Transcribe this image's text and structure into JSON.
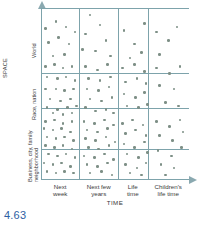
{
  "figure": {
    "number_label": "4.63",
    "number_color": "#2e5fa3"
  },
  "axes": {
    "y_title": "SPACE",
    "x_title": "TIME",
    "y_categories": [
      {
        "label": "Business, city, family",
        "label2": "neighborhood"
      },
      {
        "label": "Race, nation",
        "label2": ""
      },
      {
        "label": "World",
        "label2": ""
      }
    ],
    "x_categories": [
      {
        "line1": "Next",
        "line2": "week"
      },
      {
        "line1": "Next few",
        "line2": "years"
      },
      {
        "line1": "Life",
        "line2": "time"
      },
      {
        "line1": "Children's",
        "line2": "life time"
      }
    ]
  },
  "style": {
    "grid_color": "#7da3ab",
    "dot_color": "#7d8f86",
    "text_color": "#3a3a3a",
    "background": "#ffffff"
  },
  "chart_data": {
    "type": "scatter",
    "title": "",
    "xlabel": "TIME",
    "ylabel": "SPACE",
    "grid": true,
    "legend": "none",
    "x_tick_labels": [
      "Next week",
      "Next few years",
      "Life time",
      "Children's life time"
    ],
    "y_tick_labels": [
      "Business, city, family neighborhood",
      "Race, nation",
      "World"
    ],
    "x_band_edges_pct": [
      0,
      26,
      52,
      72,
      100
    ],
    "y_band_edges_pct": [
      0,
      18,
      42,
      62,
      100
    ],
    "cell_counts": [
      {
        "x_band": 0,
        "y_band": 0,
        "count": 46
      },
      {
        "x_band": 1,
        "y_band": 0,
        "count": 30
      },
      {
        "x_band": 2,
        "y_band": 0,
        "count": 13
      },
      {
        "x_band": 3,
        "y_band": 0,
        "count": 4
      },
      {
        "x_band": 0,
        "y_band": 1,
        "count": 35
      },
      {
        "x_band": 1,
        "y_band": 1,
        "count": 24
      },
      {
        "x_band": 2,
        "y_band": 1,
        "count": 14
      },
      {
        "x_band": 3,
        "y_band": 1,
        "count": 6
      },
      {
        "x_band": 0,
        "y_band": 2,
        "count": 22
      },
      {
        "x_band": 1,
        "y_band": 2,
        "count": 18
      },
      {
        "x_band": 2,
        "y_band": 2,
        "count": 12
      },
      {
        "x_band": 3,
        "y_band": 2,
        "count": 6
      },
      {
        "x_band": 0,
        "y_band": 3,
        "count": 5
      },
      {
        "x_band": 1,
        "y_band": 3,
        "count": 6
      },
      {
        "x_band": 2,
        "y_band": 3,
        "count": 4
      },
      {
        "x_band": 3,
        "y_band": 3,
        "count": 4
      }
    ],
    "points": [
      [
        3,
        12
      ],
      [
        10,
        8
      ],
      [
        17,
        11
      ],
      [
        5,
        20
      ],
      [
        12,
        17
      ],
      [
        19,
        21
      ],
      [
        23,
        14
      ],
      [
        8,
        28
      ],
      [
        16,
        27
      ],
      [
        33,
        4
      ],
      [
        30,
        15
      ],
      [
        40,
        10
      ],
      [
        44,
        19
      ],
      [
        28,
        24
      ],
      [
        37,
        25
      ],
      [
        47,
        28
      ],
      [
        56,
        13
      ],
      [
        63,
        21
      ],
      [
        70,
        9
      ],
      [
        60,
        29
      ],
      [
        68,
        26
      ],
      [
        78,
        14
      ],
      [
        86,
        19
      ],
      [
        92,
        11
      ],
      [
        80,
        27
      ],
      [
        3,
        34
      ],
      [
        9,
        33
      ],
      [
        15,
        35
      ],
      [
        21,
        34
      ],
      [
        4,
        40
      ],
      [
        11,
        41
      ],
      [
        17,
        40
      ],
      [
        23,
        42
      ],
      [
        3,
        47
      ],
      [
        10,
        47
      ],
      [
        16,
        48
      ],
      [
        22,
        47
      ],
      [
        6,
        53
      ],
      [
        13,
        54
      ],
      [
        20,
        53
      ],
      [
        4,
        58
      ],
      [
        11,
        59
      ],
      [
        18,
        58
      ],
      [
        24,
        57
      ],
      [
        8,
        61
      ],
      [
        15,
        62
      ],
      [
        21,
        61
      ],
      [
        30,
        34
      ],
      [
        38,
        36
      ],
      [
        45,
        33
      ],
      [
        32,
        41
      ],
      [
        40,
        42
      ],
      [
        47,
        40
      ],
      [
        31,
        47
      ],
      [
        39,
        48
      ],
      [
        46,
        46
      ],
      [
        33,
        53
      ],
      [
        41,
        54
      ],
      [
        48,
        52
      ],
      [
        30,
        58
      ],
      [
        37,
        60
      ],
      [
        44,
        59
      ],
      [
        49,
        61
      ],
      [
        55,
        35
      ],
      [
        63,
        33
      ],
      [
        70,
        37
      ],
      [
        57,
        43
      ],
      [
        65,
        41
      ],
      [
        71,
        44
      ],
      [
        56,
        50
      ],
      [
        64,
        52
      ],
      [
        70,
        49
      ],
      [
        58,
        57
      ],
      [
        66,
        58
      ],
      [
        72,
        56
      ],
      [
        78,
        35
      ],
      [
        87,
        38
      ],
      [
        94,
        34
      ],
      [
        80,
        45
      ],
      [
        90,
        47
      ],
      [
        84,
        55
      ],
      [
        93,
        57
      ],
      [
        3,
        66
      ],
      [
        9,
        65
      ],
      [
        15,
        67
      ],
      [
        21,
        66
      ],
      [
        2,
        70
      ],
      [
        8,
        71
      ],
      [
        14,
        70
      ],
      [
        20,
        72
      ],
      [
        4,
        75
      ],
      [
        10,
        76
      ],
      [
        16,
        75
      ],
      [
        22,
        77
      ],
      [
        3,
        80
      ],
      [
        9,
        81
      ],
      [
        15,
        80
      ],
      [
        21,
        82
      ],
      [
        5,
        85
      ],
      [
        11,
        86
      ],
      [
        17,
        85
      ],
      [
        23,
        87
      ],
      [
        2,
        90
      ],
      [
        8,
        91
      ],
      [
        14,
        90
      ],
      [
        20,
        92
      ],
      [
        4,
        95
      ],
      [
        10,
        96
      ],
      [
        16,
        95
      ],
      [
        22,
        96
      ],
      [
        29,
        66
      ],
      [
        36,
        67
      ],
      [
        43,
        65
      ],
      [
        49,
        68
      ],
      [
        31,
        71
      ],
      [
        38,
        72
      ],
      [
        45,
        70
      ],
      [
        30,
        76
      ],
      [
        37,
        77
      ],
      [
        44,
        75
      ],
      [
        50,
        78
      ],
      [
        32,
        81
      ],
      [
        39,
        82
      ],
      [
        46,
        80
      ],
      [
        29,
        86
      ],
      [
        36,
        87
      ],
      [
        43,
        85
      ],
      [
        49,
        88
      ],
      [
        31,
        91
      ],
      [
        38,
        92
      ],
      [
        45,
        90
      ],
      [
        33,
        96
      ],
      [
        41,
        95
      ],
      [
        48,
        97
      ],
      [
        55,
        67
      ],
      [
        62,
        65
      ],
      [
        69,
        68
      ],
      [
        57,
        73
      ],
      [
        64,
        71
      ],
      [
        71,
        74
      ],
      [
        56,
        79
      ],
      [
        63,
        81
      ],
      [
        70,
        78
      ],
      [
        58,
        85
      ],
      [
        66,
        87
      ],
      [
        72,
        84
      ],
      [
        57,
        91
      ],
      [
        65,
        93
      ],
      [
        71,
        90
      ],
      [
        60,
        96
      ],
      [
        68,
        97
      ],
      [
        78,
        66
      ],
      [
        87,
        69
      ],
      [
        94,
        65
      ],
      [
        80,
        74
      ],
      [
        89,
        77
      ],
      [
        96,
        72
      ],
      [
        79,
        83
      ],
      [
        88,
        86
      ],
      [
        95,
        81
      ],
      [
        81,
        91
      ],
      [
        90,
        93
      ],
      [
        84,
        97
      ]
    ]
  }
}
